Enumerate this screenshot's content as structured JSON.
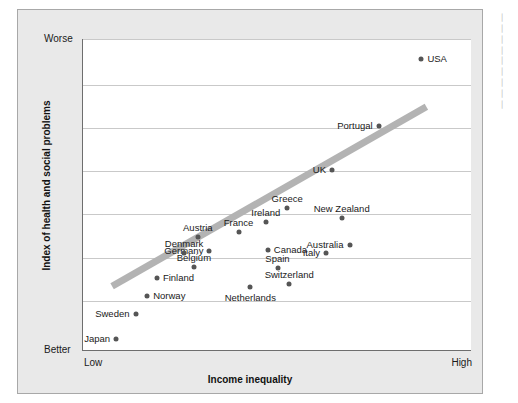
{
  "chart_data": {
    "type": "scatter",
    "title": "",
    "xlabel": "Income inequality",
    "ylabel": "Index of health and social problems",
    "x_tick_labels": [
      "Low",
      "High"
    ],
    "y_tick_labels": [
      "Worse",
      "Better"
    ],
    "y_axis_direction": "Worse at top, Better at bottom",
    "xlim": [
      0,
      100
    ],
    "ylim": [
      0,
      100
    ],
    "grid": "horizontal only, 7 gridlines",
    "legend": "none",
    "gridline_y_positions": [
      0,
      14.7,
      28.5,
      42.3,
      56.1,
      70.2,
      84.0
    ],
    "trendline": {
      "type": "linear fit",
      "color": "#b3b3b3",
      "x_start": 7.5,
      "y_start": 79.5,
      "x_end": 88.5,
      "y_end": 21.8
    },
    "point_color": "#555555",
    "points": [
      {
        "label": "USA",
        "x": 87.0,
        "y": 6.5,
        "label_pos": "right"
      },
      {
        "label": "Portugal",
        "x": 76.0,
        "y": 28.0,
        "label_pos": "left"
      },
      {
        "label": "UK",
        "x": 64.0,
        "y": 42.0,
        "label_pos": "left"
      },
      {
        "label": "Greece",
        "x": 52.5,
        "y": 54.0,
        "label_pos": "above"
      },
      {
        "label": "New Zealand",
        "x": 66.5,
        "y": 57.5,
        "label_pos": "above"
      },
      {
        "label": "Ireland",
        "x": 47.0,
        "y": 58.5,
        "label_pos": "above"
      },
      {
        "label": "France",
        "x": 40.0,
        "y": 62.0,
        "label_pos": "above"
      },
      {
        "label": "Austria",
        "x": 29.5,
        "y": 63.5,
        "label_pos": "above"
      },
      {
        "label": "Australia",
        "x": 68.5,
        "y": 66.0,
        "label_pos": "left"
      },
      {
        "label": "Canada",
        "x": 47.5,
        "y": 67.5,
        "label_pos": "right"
      },
      {
        "label": "Germany",
        "x": 32.5,
        "y": 68.0,
        "label_pos": "left"
      },
      {
        "label": "Italy",
        "x": 62.5,
        "y": 68.5,
        "label_pos": "left"
      },
      {
        "label": "Denmark",
        "x": 26.0,
        "y": 68.5,
        "label_pos": "above"
      },
      {
        "label": "Spain",
        "x": 50.0,
        "y": 73.5,
        "label_pos": "above"
      },
      {
        "label": "Belgium",
        "x": 28.5,
        "y": 73.0,
        "label_pos": "above"
      },
      {
        "label": "Switzerland",
        "x": 53.0,
        "y": 78.5,
        "label_pos": "above"
      },
      {
        "label": "Finland",
        "x": 19.0,
        "y": 76.5,
        "label_pos": "right"
      },
      {
        "label": "Netherlands",
        "x": 43.0,
        "y": 79.5,
        "label_pos": "below"
      },
      {
        "label": "Norway",
        "x": 16.5,
        "y": 82.5,
        "label_pos": "right"
      },
      {
        "label": "Sweden",
        "x": 13.5,
        "y": 88.0,
        "label_pos": "left"
      },
      {
        "label": "Japan",
        "x": 8.5,
        "y": 96.0,
        "label_pos": "left"
      }
    ]
  },
  "sidenote": {
    "text": "▕\n▕\n▕\n▕\n▕\n▕\n▕\n▕\n▕"
  }
}
